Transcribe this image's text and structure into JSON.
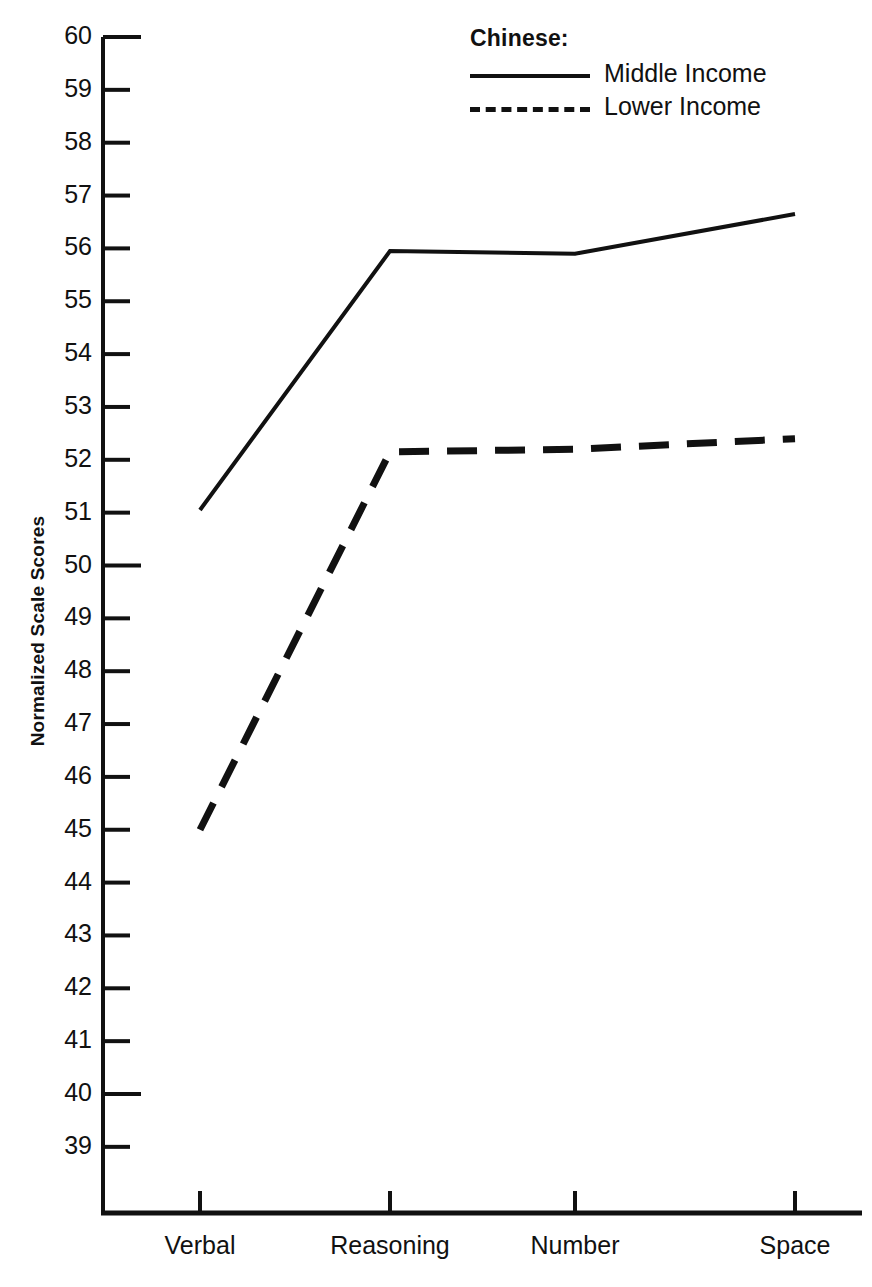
{
  "chart_data": {
    "type": "line",
    "title": "",
    "xlabel": "",
    "ylabel": "Normalized Scale Scores",
    "categories": [
      "Verbal",
      "Reasoning",
      "Number",
      "Space"
    ],
    "series": [
      {
        "name": "Middle Income",
        "style": "solid",
        "values": [
          51.05,
          55.95,
          55.9,
          56.65
        ]
      },
      {
        "name": "Lower Income",
        "style": "dashed",
        "values": [
          45.0,
          52.15,
          52.2,
          52.4
        ]
      }
    ],
    "ylim": [
      38.3,
      60
    ],
    "yticks": [
      60,
      59,
      58,
      57,
      56,
      55,
      54,
      53,
      52,
      51,
      50,
      49,
      48,
      47,
      46,
      45,
      44,
      43,
      42,
      41,
      40,
      39
    ],
    "ytick_labels": [
      "60",
      "59",
      "58",
      "57",
      "56",
      "55",
      "54",
      "53",
      "52",
      "51",
      "50",
      "49",
      "48",
      "47",
      "46",
      "45",
      "44",
      "43",
      "42",
      "41",
      "40",
      "39"
    ],
    "major_yticks": [
      60,
      50,
      40
    ],
    "grid": false,
    "legend_position": "top-right",
    "line_color": "#111111"
  },
  "legend": {
    "title": "Chinese:",
    "entries": [
      {
        "label": "Middle Income",
        "style": "solid"
      },
      {
        "label": "Lower Income",
        "style": "dashed"
      }
    ]
  },
  "axes": {
    "y_axis_label": "Normalized Scale Scores",
    "x_axis_label": ""
  }
}
